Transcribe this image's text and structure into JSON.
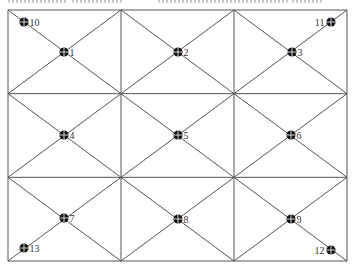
{
  "diagram": {
    "type": "grid-with-diagonals",
    "rows": 3,
    "cols": 3,
    "bounds": {
      "left": 8,
      "top": 10,
      "right": 347,
      "bottom": 261
    },
    "line_color": "#555555",
    "marker_color": "#111111",
    "marker_cross_color": "#ffffff",
    "caption_cropped": true,
    "points": [
      {
        "id": "1",
        "x": 64,
        "y": 52,
        "label_side": "right"
      },
      {
        "id": "2",
        "x": 178,
        "y": 52,
        "label_side": "right"
      },
      {
        "id": "3",
        "x": 292,
        "y": 52,
        "label_side": "right"
      },
      {
        "id": "4",
        "x": 64,
        "y": 135,
        "label_side": "right"
      },
      {
        "id": "5",
        "x": 178,
        "y": 135,
        "label_side": "right"
      },
      {
        "id": "6",
        "x": 291,
        "y": 135,
        "label_side": "right"
      },
      {
        "id": "7",
        "x": 64,
        "y": 218,
        "label_side": "right"
      },
      {
        "id": "8",
        "x": 178,
        "y": 219,
        "label_side": "right"
      },
      {
        "id": "9",
        "x": 291,
        "y": 219,
        "label_side": "right"
      },
      {
        "id": "10",
        "x": 24,
        "y": 22,
        "label_side": "right"
      },
      {
        "id": "11",
        "x": 331,
        "y": 22,
        "label_side": "left"
      },
      {
        "id": "12",
        "x": 331,
        "y": 250,
        "label_side": "left"
      },
      {
        "id": "13",
        "x": 24,
        "y": 248,
        "label_side": "right"
      }
    ]
  }
}
